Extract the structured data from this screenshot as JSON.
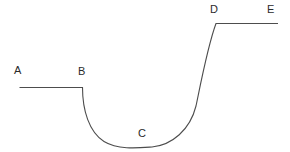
{
  "diagram": {
    "type": "line-curve-diagram",
    "background_color": "#ffffff",
    "stroke_color": "#4d4d4d",
    "stroke_width": 1.1,
    "canvas": {
      "width": 290,
      "height": 152
    },
    "labels": [
      {
        "id": "A",
        "text": "A",
        "x": 14,
        "y": 65
      },
      {
        "id": "B",
        "text": "B",
        "x": 78,
        "y": 66
      },
      {
        "id": "C",
        "text": "C",
        "x": 138,
        "y": 128
      },
      {
        "id": "D",
        "text": "D",
        "x": 210,
        "y": 4
      },
      {
        "id": "E",
        "text": "E",
        "x": 267,
        "y": 4
      }
    ],
    "path": "M 19.5 87.5 L 82.5 87.5 C 82.5 110 89 132 104 141.5 C 118 150 138 148 152 147 C 172 145 190 130 196 106 C 201 82 208 45 216 23.5 L 278 23.5",
    "segments": [
      {
        "name": "plateau-ab",
        "from": "A",
        "to": "B",
        "shape": "horizontal-line",
        "x_start": 19.5,
        "x_end": 82.5,
        "y": 87.5
      },
      {
        "name": "well-bc",
        "from": "B",
        "to": "C",
        "shape": "concave-curve-descending",
        "min_point": {
          "x": 142,
          "y": 147
        }
      },
      {
        "name": "well-cd",
        "from": "C",
        "to": "D",
        "shape": "concave-curve-ascending",
        "x_end": 216,
        "y_end": 23.5
      },
      {
        "name": "plateau-de",
        "from": "D",
        "to": "E",
        "shape": "horizontal-line",
        "x_start": 216,
        "x_end": 278,
        "y": 23.5
      }
    ]
  }
}
